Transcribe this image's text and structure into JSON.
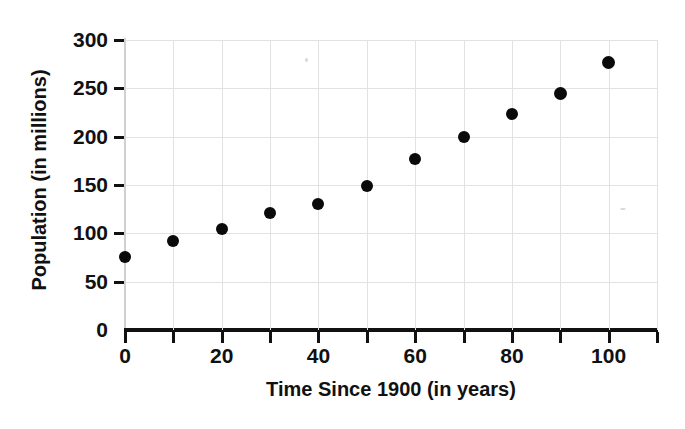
{
  "chart_data": {
    "type": "scatter",
    "title": "",
    "xlabel": "Time Since 1900 (in years)",
    "ylabel": "Population (in millions)",
    "xlim": [
      0,
      110
    ],
    "ylim": [
      0,
      300
    ],
    "grid": true,
    "legend": null,
    "x": [
      0,
      10,
      20,
      30,
      40,
      50,
      60,
      70,
      80,
      90,
      100
    ],
    "values": [
      76,
      92,
      105,
      121,
      130,
      149,
      177,
      200,
      223,
      245,
      277
    ],
    "points": [
      {
        "x": 0,
        "y": 76
      },
      {
        "x": 10,
        "y": 92
      },
      {
        "x": 20,
        "y": 105
      },
      {
        "x": 30,
        "y": 121
      },
      {
        "x": 40,
        "y": 130
      },
      {
        "x": 50,
        "y": 149
      },
      {
        "x": 60,
        "y": 177
      },
      {
        "x": 70,
        "y": 200
      },
      {
        "x": 80,
        "y": 223
      },
      {
        "x": 90,
        "y": 245
      },
      {
        "x": 100,
        "y": 277
      }
    ],
    "xticks": [
      0,
      20,
      40,
      60,
      80,
      100
    ],
    "xticks_minor": [
      10,
      30,
      50,
      70,
      90,
      110
    ],
    "yticks": [
      0,
      50,
      100,
      150,
      200,
      250,
      300
    ],
    "xtick_labels": [
      "0",
      "20",
      "40",
      "60",
      "80",
      "100"
    ],
    "ytick_labels": [
      "0",
      "50",
      "100",
      "150",
      "200",
      "250",
      "300"
    ],
    "marker": "filled-circle",
    "marker_color": "#0a0a0a",
    "grid_color": "#e2e2e2",
    "axis_color": "#111111",
    "background_color": "#ffffff"
  }
}
